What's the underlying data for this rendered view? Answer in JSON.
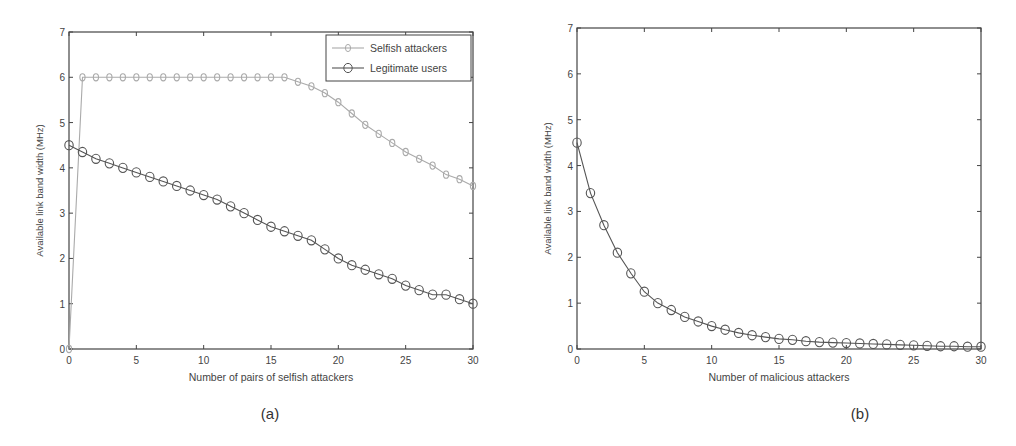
{
  "chart_data": [
    {
      "id": "a",
      "type": "line",
      "caption": "(a)",
      "title": "",
      "xlabel": "Number of pairs of selfish attackers",
      "ylabel": "Available link band width (MHz)",
      "xlim": [
        0,
        30
      ],
      "ylim": [
        0,
        7
      ],
      "xticks": [
        0,
        5,
        10,
        15,
        20,
        25,
        30
      ],
      "yticks": [
        0,
        1,
        2,
        3,
        4,
        5,
        6,
        7
      ],
      "grid": false,
      "legend_position": "upper right",
      "x": [
        0,
        1,
        2,
        3,
        4,
        5,
        6,
        7,
        8,
        9,
        10,
        11,
        12,
        13,
        14,
        15,
        16,
        17,
        18,
        19,
        20,
        21,
        22,
        23,
        24,
        25,
        26,
        27,
        28,
        29,
        30
      ],
      "series": [
        {
          "name": "Selfish attackers",
          "color": "#aaaaaa",
          "marker": "diamond-circle",
          "values": [
            0,
            6.0,
            6.0,
            6.0,
            6.0,
            6.0,
            6.0,
            6.0,
            6.0,
            6.0,
            6.0,
            6.0,
            6.0,
            6.0,
            6.0,
            6.0,
            6.0,
            5.9,
            5.8,
            5.65,
            5.45,
            5.2,
            4.95,
            4.75,
            4.55,
            4.35,
            4.2,
            4.05,
            3.85,
            3.75,
            3.6
          ]
        },
        {
          "name": "Legitimate users",
          "color": "#555555",
          "marker": "circle",
          "values": [
            4.5,
            4.35,
            4.2,
            4.1,
            4.0,
            3.9,
            3.8,
            3.7,
            3.6,
            3.5,
            3.4,
            3.3,
            3.15,
            3.0,
            2.85,
            2.7,
            2.6,
            2.5,
            2.4,
            2.2,
            2.0,
            1.85,
            1.75,
            1.65,
            1.55,
            1.4,
            1.3,
            1.2,
            1.2,
            1.1,
            1.0
          ]
        }
      ]
    },
    {
      "id": "b",
      "type": "line",
      "caption": "(b)",
      "title": "",
      "xlabel": "Number of malicious attackers",
      "ylabel": "Available link band width (MHz)",
      "xlim": [
        0,
        30
      ],
      "ylim": [
        0,
        7
      ],
      "xticks": [
        0,
        5,
        10,
        15,
        20,
        25,
        30
      ],
      "yticks": [
        0,
        1,
        2,
        3,
        4,
        5,
        6,
        7
      ],
      "grid": false,
      "x": [
        0,
        1,
        2,
        3,
        4,
        5,
        6,
        7,
        8,
        9,
        10,
        11,
        12,
        13,
        14,
        15,
        16,
        17,
        18,
        19,
        20,
        21,
        22,
        23,
        24,
        25,
        26,
        27,
        28,
        29,
        30
      ],
      "series": [
        {
          "name": "Available link band width",
          "color": "#555555",
          "marker": "circle",
          "values": [
            4.5,
            3.4,
            2.7,
            2.1,
            1.65,
            1.25,
            1.0,
            0.85,
            0.7,
            0.6,
            0.5,
            0.42,
            0.35,
            0.3,
            0.26,
            0.22,
            0.2,
            0.17,
            0.15,
            0.14,
            0.13,
            0.12,
            0.11,
            0.1,
            0.09,
            0.08,
            0.07,
            0.06,
            0.06,
            0.05,
            0.05
          ]
        }
      ]
    }
  ]
}
